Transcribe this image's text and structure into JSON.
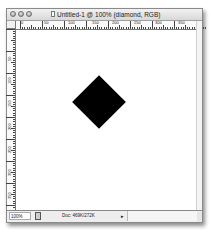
{
  "window": {
    "title": "Untitled-1 @ 100% (diamond, RGB)",
    "traffic_lights": [
      "close-button",
      "minimize-button",
      "zoom-button"
    ]
  },
  "rulers": {
    "horizontal": {
      "labels": [
        "0",
        "50",
        "100",
        "150",
        "200",
        "250",
        "300",
        "350"
      ],
      "label_positions_px": [
        4,
        27,
        51,
        75,
        95,
        117,
        138,
        161
      ]
    },
    "vertical": {
      "labels": [
        "50",
        "100",
        "150",
        "200",
        "250",
        "300",
        "350"
      ],
      "label_positions_px": [
        22,
        45,
        68,
        91,
        114,
        137,
        160
      ]
    }
  },
  "canvas": {
    "background": "#ffffff",
    "shape": {
      "name": "diamond",
      "color": "#000000",
      "center_x": 99,
      "center_y": 102,
      "size": 38
    }
  },
  "statusbar": {
    "zoom": "100%",
    "doc_info": "Doc: 469K/272K",
    "arrow": "▸"
  }
}
